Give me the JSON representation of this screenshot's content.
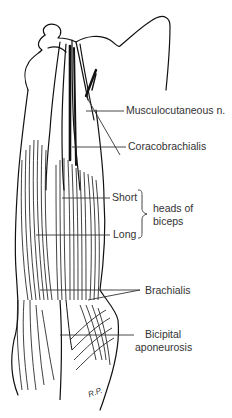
{
  "figure": {
    "type": "anatomical-illustration",
    "ink_color": "#111111",
    "label_color": "#333333",
    "background": "#ffffff"
  },
  "labels": {
    "musculocutaneous": "Musculocutaneous n.",
    "coracobrachialis": "Coracobrachialis",
    "short": "Short",
    "long": "Long",
    "heads_of": "heads of",
    "biceps": "biceps",
    "brachialis": "Brachialis",
    "bicipital": "Bicipital",
    "aponeurosis": "aponeurosis"
  },
  "signature": "R.P."
}
